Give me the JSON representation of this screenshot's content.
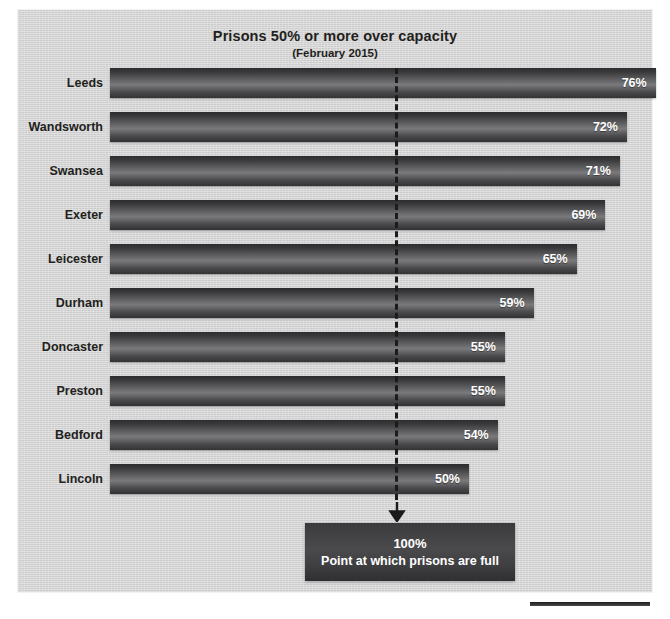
{
  "chart_data": {
    "type": "bar",
    "orientation": "horizontal",
    "title": "Prisons 50% or more over capacity",
    "subtitle": "(February 2015)",
    "xlabel": "",
    "ylabel": "",
    "categories": [
      "Leeds",
      "Wandsworth",
      "Swansea",
      "Exeter",
      "Leicester",
      "Durham",
      "Doncaster",
      "Preston",
      "Bedford",
      "Lincoln"
    ],
    "values": [
      76,
      72,
      71,
      69,
      65,
      59,
      55,
      55,
      54,
      50
    ],
    "value_labels": [
      "76%",
      "72%",
      "71%",
      "69%",
      "65%",
      "59%",
      "55%",
      "55%",
      "54%",
      "50%"
    ],
    "value_unit": "%",
    "xlim": [
      0,
      80
    ],
    "grid": false,
    "legend": false,
    "reference_line": {
      "label": "100%",
      "description": "Point at which prisons are full",
      "value": 50,
      "style": "dashed",
      "color": "#1b1b1b"
    },
    "colors": {
      "bar_dark": "#2c2c2e",
      "bar_light": "#7a7a7d",
      "panel_background": "#d2d2d2",
      "text": "#231f20",
      "value_text": "#ffffff",
      "callout_background": "#3e3e40"
    }
  },
  "callout": {
    "value": "100%",
    "text": "Point at which prisons are full"
  },
  "icons": {
    "down_arrow": "down-arrow-icon"
  }
}
